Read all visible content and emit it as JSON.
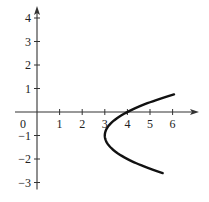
{
  "chart_data": {
    "type": "line",
    "title": "",
    "xlabel": "",
    "ylabel": "",
    "xlim": [
      -1,
      7
    ],
    "ylim": [
      -3.3,
      4.5
    ],
    "x_ticks": [
      1,
      2,
      3,
      4,
      5,
      6
    ],
    "x_tick_labels": [
      "1",
      "2",
      "3",
      "4",
      "5",
      "6"
    ],
    "y_ticks": [
      4,
      3,
      2,
      1,
      -1,
      -2,
      -3
    ],
    "y_tick_labels": [
      "4",
      "3",
      "2",
      "1",
      "−1",
      "−2",
      "−3"
    ],
    "origin_label": "0",
    "grid": false,
    "series": [
      {
        "name": "parabola x = (y+1)^2 + 3",
        "equation": "x = (y + 1)^2 + 3",
        "vertex": [
          3,
          -1
        ],
        "y_range": [
          -2.6,
          0.75
        ],
        "points": [
          [
            5.56,
            -2.6
          ],
          [
            4.96,
            -2.4
          ],
          [
            4.44,
            -2.2
          ],
          [
            4.0,
            -2.0
          ],
          [
            3.64,
            -1.8
          ],
          [
            3.36,
            -1.6
          ],
          [
            3.16,
            -1.4
          ],
          [
            3.04,
            -1.2
          ],
          [
            3.0,
            -1.0
          ],
          [
            3.04,
            -0.8
          ],
          [
            3.16,
            -0.6
          ],
          [
            3.36,
            -0.4
          ],
          [
            3.64,
            -0.2
          ],
          [
            4.0,
            0.0
          ],
          [
            4.44,
            0.2
          ],
          [
            4.96,
            0.4
          ],
          [
            5.56,
            0.6
          ],
          [
            6.06,
            0.75
          ]
        ]
      }
    ]
  }
}
